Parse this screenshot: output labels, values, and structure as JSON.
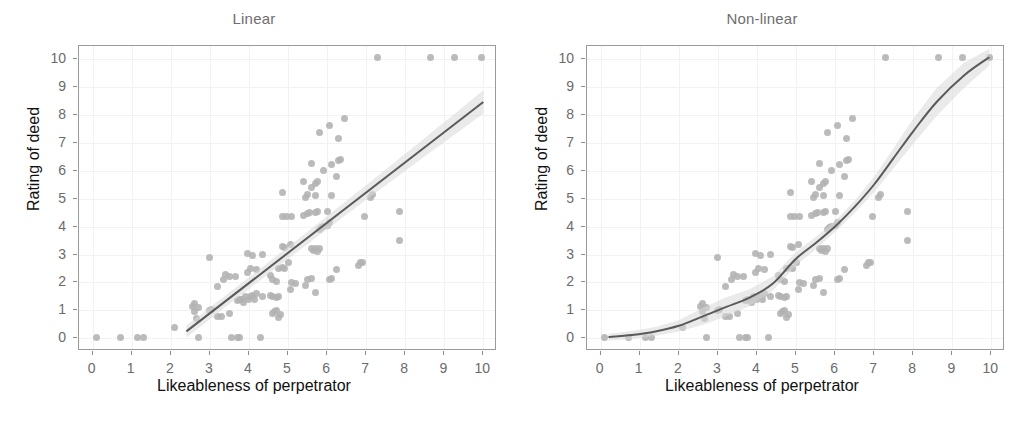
{
  "figure": {
    "width": 1016,
    "height": 427,
    "background": "#ffffff",
    "point_color": "#b2b2b2",
    "line_color": "#5a5a5a",
    "ribbon_color": "#d9d9d9",
    "grid_color": "#f2f2f2",
    "frame_color": "#9a9a9a",
    "title_color": "#6e6e6e",
    "tick_color": "#6b6b6b",
    "axis_title_color": "#111111"
  },
  "panels": [
    {
      "id": "linear",
      "title": "Linear",
      "xlabel": "Likeableness of perpetrator",
      "ylabel": "Rating of deed"
    },
    {
      "id": "nonlinear",
      "title": "Non-linear",
      "xlabel": "Likeableness of perpetrator",
      "ylabel": "Rating of deed"
    }
  ],
  "axis": {
    "x_ticks": [
      "0",
      "1",
      "2",
      "3",
      "4",
      "5",
      "6",
      "7",
      "8",
      "9",
      "10"
    ],
    "y_ticks": [
      "10",
      "9",
      "8",
      "7",
      "6",
      "5",
      "4",
      "3",
      "2",
      "1",
      "0"
    ],
    "xlim": [
      -0.35,
      10.35
    ],
    "ylim": [
      -0.45,
      10.45
    ]
  },
  "chart_data": {
    "type": "scatter",
    "xlabel": "Likeableness of perpetrator",
    "ylabel": "Rating of deed",
    "xlim": [
      -0.35,
      10.35
    ],
    "ylim": [
      -0.45,
      10.45
    ],
    "grid": true,
    "legend": "none",
    "n_points": 121,
    "panels": [
      "Linear",
      "Non-linear"
    ],
    "note": "Both panels show the same scatter of 121 observations; the left panel overlays a straight OLS fit with 95% confidence ribbon, the right panel overlays a smooth monotone increasing (loess/GAM) fit with 95% confidence ribbon.",
    "points": [
      [
        0.1,
        0.05
      ],
      [
        0.7,
        0.05
      ],
      [
        1.15,
        0.05
      ],
      [
        1.3,
        0.05
      ],
      [
        2.1,
        0.4
      ],
      [
        2.7,
        0.05
      ],
      [
        3.55,
        0.05
      ],
      [
        3.7,
        0.05
      ],
      [
        3.75,
        0.05
      ],
      [
        4.3,
        0.05
      ],
      [
        2.55,
        1.15
      ],
      [
        2.6,
        1.25
      ],
      [
        2.6,
        0.95
      ],
      [
        2.65,
        0.7
      ],
      [
        2.7,
        1.1
      ],
      [
        3.0,
        1.0
      ],
      [
        3.05,
        1.05
      ],
      [
        3.2,
        0.8
      ],
      [
        3.3,
        0.8
      ],
      [
        3.5,
        0.9
      ],
      [
        3.7,
        1.35
      ],
      [
        3.75,
        1.4
      ],
      [
        3.8,
        1.4
      ],
      [
        3.85,
        1.3
      ],
      [
        3.9,
        1.5
      ],
      [
        4.0,
        1.4
      ],
      [
        4.05,
        1.5
      ],
      [
        4.1,
        1.55
      ],
      [
        4.15,
        1.4
      ],
      [
        4.2,
        1.6
      ],
      [
        4.35,
        1.5
      ],
      [
        4.55,
        1.55
      ],
      [
        4.6,
        1.5
      ],
      [
        4.7,
        1.45
      ],
      [
        4.75,
        1.5
      ],
      [
        4.6,
        0.9
      ],
      [
        4.65,
        0.95
      ],
      [
        4.7,
        1.0
      ],
      [
        4.75,
        0.75
      ],
      [
        4.8,
        0.85
      ],
      [
        3.2,
        1.85
      ],
      [
        3.35,
        2.1
      ],
      [
        3.4,
        2.3
      ],
      [
        3.5,
        2.2
      ],
      [
        3.65,
        2.2
      ],
      [
        3.95,
        2.35
      ],
      [
        4.05,
        2.5
      ],
      [
        4.2,
        2.45
      ],
      [
        4.55,
        2.25
      ],
      [
        4.6,
        2.1
      ],
      [
        4.7,
        2.05
      ],
      [
        4.75,
        2.5
      ],
      [
        4.85,
        2.55
      ],
      [
        4.9,
        2.5
      ],
      [
        5.0,
        2.7
      ],
      [
        5.05,
        1.75
      ],
      [
        5.1,
        2.0
      ],
      [
        5.2,
        1.95
      ],
      [
        5.45,
        1.9
      ],
      [
        5.5,
        2.1
      ],
      [
        5.6,
        2.15
      ],
      [
        5.7,
        1.65
      ],
      [
        6.05,
        2.1
      ],
      [
        6.1,
        2.15
      ],
      [
        6.25,
        2.45
      ],
      [
        6.8,
        2.6
      ],
      [
        6.85,
        2.7
      ],
      [
        6.9,
        2.7
      ],
      [
        3.0,
        2.9
      ],
      [
        3.95,
        3.05
      ],
      [
        4.1,
        2.95
      ],
      [
        4.35,
        3.0
      ],
      [
        4.85,
        3.3
      ],
      [
        4.9,
        3.25
      ],
      [
        5.05,
        3.35
      ],
      [
        5.6,
        3.2
      ],
      [
        5.65,
        3.15
      ],
      [
        5.7,
        3.2
      ],
      [
        5.75,
        3.1
      ],
      [
        5.8,
        3.2
      ],
      [
        7.85,
        3.5
      ],
      [
        5.8,
        3.9
      ],
      [
        5.85,
        3.95
      ],
      [
        5.9,
        4.0
      ],
      [
        6.0,
        4.05
      ],
      [
        6.05,
        4.15
      ],
      [
        4.85,
        4.35
      ],
      [
        4.95,
        4.35
      ],
      [
        5.1,
        4.35
      ],
      [
        5.4,
        4.4
      ],
      [
        5.5,
        4.45
      ],
      [
        5.55,
        4.5
      ],
      [
        5.7,
        4.5
      ],
      [
        5.75,
        4.55
      ],
      [
        6.0,
        4.55
      ],
      [
        6.95,
        4.35
      ],
      [
        7.85,
        4.55
      ],
      [
        4.85,
        5.2
      ],
      [
        5.45,
        5.05
      ],
      [
        5.5,
        5.15
      ],
      [
        5.6,
        5.4
      ],
      [
        5.7,
        5.1
      ],
      [
        6.1,
        5.1
      ],
      [
        7.1,
        5.05
      ],
      [
        7.15,
        5.15
      ],
      [
        5.4,
        5.6
      ],
      [
        5.7,
        5.55
      ],
      [
        5.75,
        5.6
      ],
      [
        6.25,
        5.8
      ],
      [
        5.6,
        6.25
      ],
      [
        5.9,
        6.0
      ],
      [
        6.1,
        6.2
      ],
      [
        6.3,
        6.35
      ],
      [
        6.35,
        6.4
      ],
      [
        5.8,
        7.35
      ],
      [
        6.05,
        7.6
      ],
      [
        6.3,
        7.15
      ],
      [
        6.45,
        7.85
      ],
      [
        7.3,
        10.05
      ],
      [
        8.65,
        10.05
      ],
      [
        9.25,
        10.05
      ],
      [
        9.95,
        10.05
      ]
    ],
    "linear_fit": {
      "type": "line",
      "x_start": 2.4,
      "y_start": 0.25,
      "x_end": 10.0,
      "y_end": 8.45,
      "slope": 1.08,
      "intercept": -2.34,
      "ribbon_half_width_at_x_start": 0.22,
      "ribbon_half_width_at_x_mid": 0.16,
      "ribbon_half_width_at_x_end": 0.42
    },
    "nonlinear_fit": {
      "type": "smooth",
      "x": [
        0.2,
        0.8,
        1.4,
        2.0,
        2.6,
        3.2,
        3.8,
        4.4,
        5.0,
        5.5,
        6.0,
        6.5,
        7.0,
        7.5,
        8.0,
        8.6,
        9.3,
        9.95
      ],
      "y": [
        0.05,
        0.12,
        0.25,
        0.45,
        0.78,
        1.12,
        1.45,
        1.95,
        2.85,
        3.4,
        4.0,
        4.7,
        5.5,
        6.45,
        7.4,
        8.45,
        9.4,
        10.05
      ],
      "ribbon_half_width": [
        0.12,
        0.14,
        0.16,
        0.2,
        0.3,
        0.34,
        0.3,
        0.26,
        0.24,
        0.22,
        0.2,
        0.22,
        0.28,
        0.36,
        0.45,
        0.5,
        0.45,
        0.3
      ]
    }
  }
}
